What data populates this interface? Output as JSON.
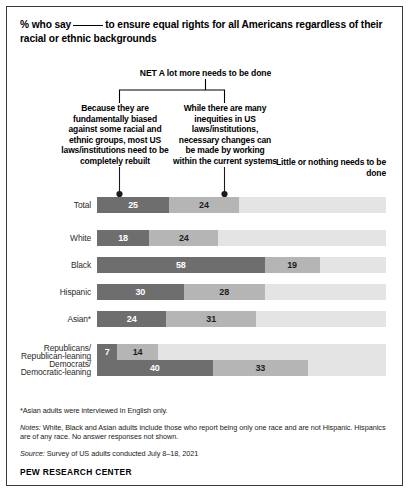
{
  "chart_data": {
    "type": "bar",
    "subtype": "stacked-horizontal-100",
    "title_part1": "% who say",
    "title_part2": "to ensure equal rights for all Americans regardless of their racial or ethnic backgrounds",
    "net_label": "NET A lot more needs to be done",
    "xlabel": "",
    "ylabel": "",
    "xlim": [
      0,
      100
    ],
    "grid": false,
    "legend_position": "top",
    "categories": [
      "Total",
      "White",
      "Black",
      "Hispanic",
      "Asian*",
      "Republicans/Republican-leaning",
      "Democrats/Democratic-leaning"
    ],
    "series": [
      {
        "name": "Because they are fundamentally biased against some racial and ethnic groups, most US laws/institutions need to be completely rebuilt",
        "short_name": "Completely rebuilt",
        "color": "#6e6e6e",
        "values": [
          25,
          18,
          58,
          30,
          24,
          7,
          40
        ]
      },
      {
        "name": "While there are many inequities in US laws/institutions, necessary changes can be made by working within the current systems",
        "short_name": "Changes within current systems",
        "color": "#b5b5b5",
        "values": [
          24,
          24,
          19,
          28,
          31,
          14,
          33
        ]
      },
      {
        "name": "Little or nothing needs to be done",
        "short_name": "Little or nothing",
        "color": "#e4e4e4",
        "values": [
          51,
          58,
          23,
          42,
          45,
          79,
          27
        ],
        "labels_shown": false
      }
    ]
  },
  "legend": {
    "left": "Because they are fundamentally biased against some racial and ethnic groups, most US laws/institutions need to be completely rebuilt",
    "middle": "While there are many inequities in US laws/institutions, necessary changes can be made by working within the current systems",
    "right": "Little or nothing needs to be done"
  },
  "rows": [
    {
      "label_line1": "Total",
      "label_line2": "",
      "a": 25,
      "b": 24,
      "a_text": "25",
      "b_text": "24"
    },
    {
      "label_line1": "White",
      "label_line2": "",
      "a": 18,
      "b": 24,
      "a_text": "18",
      "b_text": "24"
    },
    {
      "label_line1": "Black",
      "label_line2": "",
      "a": 58,
      "b": 19,
      "a_text": "58",
      "b_text": "19"
    },
    {
      "label_line1": "Hispanic",
      "label_line2": "",
      "a": 30,
      "b": 28,
      "a_text": "30",
      "b_text": "28"
    },
    {
      "label_line1": "Asian*",
      "label_line2": "",
      "a": 24,
      "b": 31,
      "a_text": "24",
      "b_text": "31"
    },
    {
      "label_line1": "Republicans/",
      "label_line2": "Republican-leaning",
      "a": 7,
      "b": 14,
      "a_text": "7",
      "b_text": "14"
    },
    {
      "label_line1": "Democrats/",
      "label_line2": "Democratic-leaning",
      "a": 40,
      "b": 33,
      "a_text": "40",
      "b_text": "33"
    }
  ],
  "footnotes": {
    "asterisk": "*Asian adults were interviewed in English only.",
    "notes_prefix": "Notes:",
    "notes_body": "White, Black and Asian adults include those who report being only one race and are not Hispanic. Hispanics are of any race. No answer responses not shown.",
    "source_prefix": "Source:",
    "source_body": "Survey of US adults conducted July 8–18, 2021",
    "brand": "PEW RESEARCH CENTER"
  },
  "colors": {
    "segment_a": "#6e6e6e",
    "segment_b": "#b5b5b5",
    "segment_c": "#e4e4e4",
    "border": "#3a3a3a"
  }
}
